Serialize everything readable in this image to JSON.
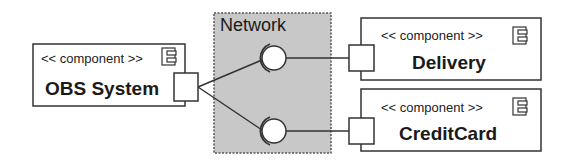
{
  "diagram": {
    "type": "uml-component-diagram",
    "network": {
      "label": "Network",
      "fill": "#c8c8c8"
    },
    "components": [
      {
        "id": "obs",
        "stereotype": "<< component >>",
        "name": "OBS System"
      },
      {
        "id": "delivery",
        "stereotype": "<< component >>",
        "name": "Delivery"
      },
      {
        "id": "creditcard",
        "stereotype": "<< component >>",
        "name": "CreditCard"
      }
    ],
    "connections": [
      {
        "from": "OBS System",
        "to": "Delivery",
        "via": "Network"
      },
      {
        "from": "OBS System",
        "to": "CreditCard",
        "via": "Network"
      }
    ]
  }
}
